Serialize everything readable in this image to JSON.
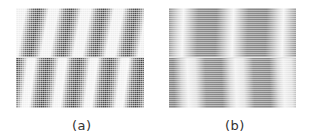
{
  "figure": {
    "panels": [
      {
        "id": "a",
        "label": "(a)",
        "description": "fine dotted pattern with slanted dark/light stripes, split into upper and lower halves"
      },
      {
        "id": "b",
        "label": "(b)",
        "description": "horizontally scan-lined pattern with broad gray/white bands, split into upper and lower halves"
      }
    ]
  },
  "colors": {
    "background": "#ffffff",
    "dark_stripe": "#4a4a4a",
    "light_stripe": "#ededed",
    "caption_text": "#333333"
  }
}
